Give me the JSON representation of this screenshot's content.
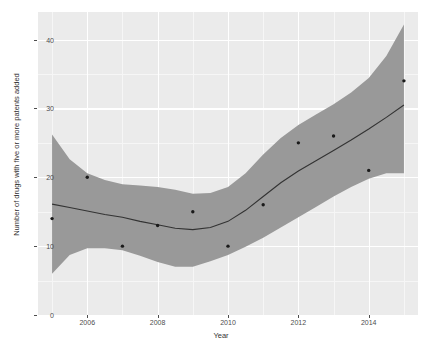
{
  "chart_data": {
    "type": "scatter",
    "title": "",
    "xlabel": "Year",
    "ylabel": "Number of drugs with five or more patents added",
    "xlim": [
      2004.6,
      2015.4
    ],
    "ylim": [
      0,
      44
    ],
    "grid": true,
    "legend": null,
    "x": [
      2005,
      2006,
      2007,
      2008,
      2009,
      2010,
      2011,
      2012,
      2013,
      2014,
      2015
    ],
    "values": [
      14,
      20,
      10,
      13,
      15,
      10,
      16,
      25,
      26,
      21,
      34
    ],
    "series": [
      {
        "name": "observed points",
        "type": "scatter",
        "x": [
          2005,
          2006,
          2007,
          2008,
          2009,
          2010,
          2011,
          2012,
          2013,
          2014,
          2015
        ],
        "values": [
          14,
          20,
          10,
          13,
          15,
          10,
          16,
          25,
          26,
          21,
          34
        ],
        "marker": "filled-circle",
        "color": "#1a1a1a"
      },
      {
        "name": "loess smooth",
        "type": "line",
        "x": [
          2005,
          2005.5,
          2006,
          2006.5,
          2007,
          2007.5,
          2008,
          2008.5,
          2009,
          2009.5,
          2010,
          2010.5,
          2011,
          2011.5,
          2012,
          2012.5,
          2013,
          2013.5,
          2014,
          2014.5,
          2015
        ],
        "values": [
          16.1,
          15.6,
          15.1,
          14.6,
          14.2,
          13.6,
          13.1,
          12.6,
          12.4,
          12.7,
          13.6,
          15.2,
          17.2,
          19.2,
          20.9,
          22.4,
          23.9,
          25.4,
          27.0,
          28.7,
          30.5
        ],
        "color": "#333333"
      },
      {
        "name": "confidence ribbon upper",
        "type": "line",
        "x": [
          2005,
          2005.5,
          2006,
          2006.5,
          2007,
          2007.5,
          2008,
          2008.5,
          2009,
          2009.5,
          2010,
          2010.5,
          2011,
          2011.5,
          2012,
          2012.5,
          2013,
          2013.5,
          2014,
          2014.5,
          2015
        ],
        "values": [
          26.2,
          22.6,
          20.6,
          19.6,
          19.0,
          18.8,
          18.6,
          18.2,
          17.6,
          17.7,
          18.6,
          20.6,
          23.3,
          25.7,
          27.6,
          29.1,
          30.6,
          32.3,
          34.4,
          37.6,
          42.2
        ],
        "color": "#999999"
      },
      {
        "name": "confidence ribbon lower",
        "type": "line",
        "x": [
          2005,
          2005.5,
          2006,
          2006.5,
          2007,
          2007.5,
          2008,
          2008.5,
          2009,
          2009.5,
          2010,
          2010.5,
          2011,
          2011.5,
          2012,
          2012.5,
          2013,
          2013.5,
          2014,
          2014.5,
          2015
        ],
        "values": [
          6.0,
          8.7,
          9.7,
          9.7,
          9.4,
          8.6,
          7.7,
          7.0,
          7.0,
          7.8,
          8.7,
          9.9,
          11.2,
          12.7,
          14.2,
          15.7,
          17.2,
          18.6,
          19.8,
          20.6,
          20.6
        ],
        "color": "#999999"
      }
    ],
    "yticks": [
      0,
      10,
      20,
      30,
      40
    ],
    "ytick_labels": [
      "0",
      "10",
      "20",
      "30",
      "40"
    ],
    "xticks": [
      2006,
      2008,
      2010,
      2012,
      2014
    ],
    "xtick_labels": [
      "2006",
      "2008",
      "2010",
      "2012",
      "2014"
    ],
    "xminor": [
      2005,
      2007,
      2009,
      2011,
      2013,
      2015
    ],
    "yminor": [
      5,
      15,
      25,
      35
    ],
    "colors": {
      "panel_background": "#ebebeb",
      "figure_background": "#ffffff",
      "grid_major": "#ffffff",
      "grid_minor": "#f6f6f6",
      "ribbon": "#999999",
      "smooth_line": "#333333",
      "point": "#1a1a1a",
      "axis_text": "#4d4d4d",
      "axis_title": "#333333"
    }
  }
}
